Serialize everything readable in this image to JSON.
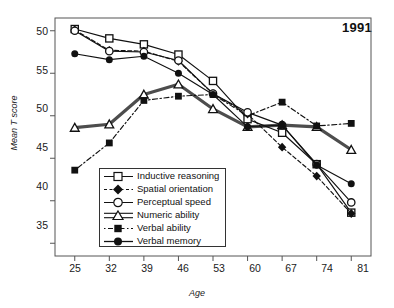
{
  "chart_data": {
    "type": "line",
    "title": "1991",
    "xlabel": "Age",
    "ylabel": "Mean T score",
    "grid": false,
    "legend_position": "inside-bottom-left",
    "x": [
      25,
      32,
      39,
      46,
      53,
      60,
      67,
      74,
      81
    ],
    "categories": [
      "25",
      "32",
      "39",
      "46",
      "53",
      "60",
      "67",
      "74",
      "81"
    ],
    "xtick_labels": [
      "25",
      "32",
      "39",
      "46",
      "53",
      "60",
      "67",
      "74",
      "81"
    ],
    "ytick_labels": [
      "50",
      "55",
      "50",
      "45",
      "40",
      "35"
    ],
    "ytick_values": [
      60,
      55,
      50,
      45,
      40,
      35
    ],
    "ylim": [
      33.5,
      61.5
    ],
    "xlim": [
      21,
      85
    ],
    "series": [
      {
        "name": "Inductive reasoning",
        "marker": "open-square",
        "line": "solid",
        "values": [
          60.2,
          59.1,
          58.4,
          57.2,
          54.1,
          49.6,
          48.0,
          44.3,
          38.6
        ]
      },
      {
        "name": "Spatial orientation",
        "marker": "filled-diamond",
        "line": "dashed",
        "values": [
          60.1,
          57.7,
          57.6,
          56.4,
          52.6,
          50.2,
          46.3,
          42.9,
          38.5
        ]
      },
      {
        "name": "Perceptual speed",
        "marker": "open-circle",
        "line": "solid",
        "values": [
          60.0,
          57.6,
          57.5,
          56.5,
          52.6,
          50.4,
          48.9,
          44.3,
          39.8
        ]
      },
      {
        "name": "Numeric ability",
        "marker": "open-triangle",
        "line": "thick-double",
        "values": [
          48.6,
          49.0,
          52.5,
          53.7,
          50.8,
          48.7,
          48.9,
          48.7,
          46.0
        ]
      },
      {
        "name": "Verbal ability",
        "marker": "filled-square",
        "line": "dash-dot",
        "values": [
          43.6,
          46.8,
          51.8,
          52.3,
          52.5,
          50.0,
          51.6,
          48.8,
          49.1
        ]
      },
      {
        "name": "Verbal memory",
        "marker": "filled-circle",
        "line": "solid",
        "values": [
          57.3,
          56.6,
          57.0,
          55.0,
          52.5,
          48.7,
          48.9,
          44.2,
          42.0
        ]
      }
    ]
  }
}
